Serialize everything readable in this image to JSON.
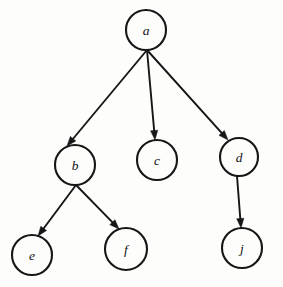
{
  "diagram": {
    "kind": "directed-tree",
    "background_color": "#fdfdfc",
    "stroke_color": "#161616",
    "label_color": "#111111",
    "canvas": {
      "width": 283,
      "height": 287
    },
    "node_radius": 20,
    "nodes": [
      {
        "id": "a",
        "label": "a",
        "cx": 146,
        "cy": 30,
        "r": 20
      },
      {
        "id": "b",
        "label": "b",
        "cx": 75,
        "cy": 165,
        "r": 20
      },
      {
        "id": "c",
        "label": "c",
        "cx": 157,
        "cy": 160,
        "r": 20
      },
      {
        "id": "d",
        "label": "d",
        "cx": 239,
        "cy": 157,
        "r": 19
      },
      {
        "id": "e",
        "label": "e",
        "cx": 32,
        "cy": 255,
        "r": 20
      },
      {
        "id": "f",
        "label": "f",
        "cx": 126,
        "cy": 249,
        "r": 21
      },
      {
        "id": "j",
        "label": "j",
        "cx": 242,
        "cy": 248,
        "r": 20
      }
    ],
    "edges": [
      {
        "id": "a-b",
        "from": "a",
        "to": "b",
        "x1": 147,
        "y1": 50,
        "x2": 67,
        "y2": 146,
        "directed": true
      },
      {
        "id": "a-c",
        "from": "a",
        "to": "c",
        "x1": 147,
        "y1": 50,
        "x2": 155,
        "y2": 140,
        "directed": true
      },
      {
        "id": "a-d",
        "from": "a",
        "to": "d",
        "x1": 147,
        "y1": 50,
        "x2": 228,
        "y2": 140,
        "directed": true
      },
      {
        "id": "b-e",
        "from": "b",
        "to": "e",
        "x1": 76,
        "y1": 185,
        "x2": 38,
        "y2": 236,
        "directed": true
      },
      {
        "id": "b-f",
        "from": "b",
        "to": "f",
        "x1": 76,
        "y1": 185,
        "x2": 119,
        "y2": 229,
        "directed": true
      },
      {
        "id": "d-j",
        "from": "d",
        "to": "j",
        "x1": 237,
        "y1": 176,
        "x2": 241,
        "y2": 228,
        "directed": true
      }
    ]
  },
  "chart_data": {
    "type": "diagram",
    "nodes": [
      "a",
      "b",
      "c",
      "d",
      "e",
      "f",
      "j"
    ],
    "edges": [
      [
        "a",
        "b"
      ],
      [
        "a",
        "c"
      ],
      [
        "a",
        "d"
      ],
      [
        "b",
        "e"
      ],
      [
        "b",
        "f"
      ],
      [
        "d",
        "j"
      ]
    ],
    "root": "a",
    "leaves": [
      "c",
      "e",
      "f",
      "j"
    ],
    "directed": true,
    "levels": [
      [
        "a"
      ],
      [
        "b",
        "c",
        "d"
      ],
      [
        "e",
        "f",
        "j"
      ]
    ],
    "legend": [],
    "annotations": []
  }
}
